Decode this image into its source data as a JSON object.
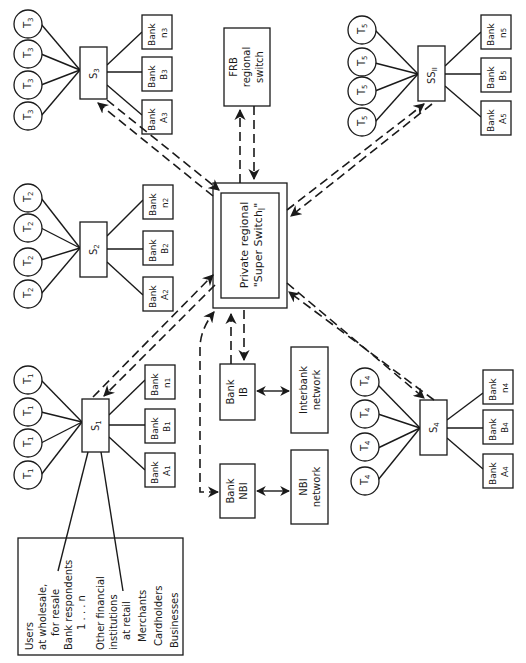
{
  "diagram": {
    "orientation": "rotated 90 degrees counter-clockwise (text reads bottom-to-top)",
    "central_switch": {
      "line1": "Private regional",
      "line2": "\"Super Switch",
      "subscript": "I",
      "close_quote": "\""
    },
    "frb_switch": {
      "line1": "FRB",
      "line2": "regional",
      "line3": "switch"
    },
    "bank_ib": {
      "line1": "Bank",
      "line2": "IB"
    },
    "interbank_network": {
      "line1": "Interbank",
      "line2": "network"
    },
    "bank_nbi": {
      "line1": "Bank",
      "line2": "NBI"
    },
    "nbi_network": {
      "line1": "NBI",
      "line2": "network"
    },
    "clusters": [
      {
        "id": "s1",
        "switch": "S",
        "sub": "1",
        "terminal": "T",
        "tsub": "1",
        "banks": [
          {
            "l1": "Bank",
            "l2": "A",
            "sub": "1"
          },
          {
            "l1": "Bank",
            "l2": "B",
            "sub": "1"
          },
          {
            "l1": "Bank",
            "l2": "n",
            "sub": "1"
          }
        ]
      },
      {
        "id": "s2",
        "switch": "S",
        "sub": "2",
        "terminal": "T",
        "tsub": "2",
        "banks": [
          {
            "l1": "Bank",
            "l2": "A",
            "sub": "2"
          },
          {
            "l1": "Bank",
            "l2": "B",
            "sub": "2"
          },
          {
            "l1": "Bank",
            "l2": "n",
            "sub": "2"
          }
        ]
      },
      {
        "id": "s3",
        "switch": "S",
        "sub": "3",
        "terminal": "T",
        "tsub": "3",
        "banks": [
          {
            "l1": "Bank",
            "l2": "A",
            "sub": "3"
          },
          {
            "l1": "Bank",
            "l2": "B",
            "sub": "3"
          },
          {
            "l1": "Bank",
            "l2": "n",
            "sub": "3"
          }
        ]
      },
      {
        "id": "s4",
        "switch": "S",
        "sub": "4",
        "terminal": "T",
        "tsub": "4",
        "banks": [
          {
            "l1": "Bank",
            "l2": "A",
            "sub": "4"
          },
          {
            "l1": "Bank",
            "l2": "B",
            "sub": "4"
          },
          {
            "l1": "Bank",
            "l2": "n",
            "sub": "4"
          }
        ]
      },
      {
        "id": "ss2",
        "switch": "SS",
        "sub": "II",
        "terminal": "T",
        "tsub": "5",
        "banks": [
          {
            "l1": "Bank",
            "l2": "A",
            "sub": "5"
          },
          {
            "l1": "Bank",
            "l2": "B",
            "sub": "5"
          },
          {
            "l1": "Bank",
            "l2": "n",
            "sub": "5"
          }
        ]
      }
    ],
    "users_box": {
      "lines": [
        "Users",
        "at wholesale,",
        "for resale",
        "Bank respondents",
        "1 . . . n",
        "Other financial",
        "institutions",
        "at retail",
        "Merchants",
        "Cardholders",
        "Businesses"
      ]
    }
  }
}
